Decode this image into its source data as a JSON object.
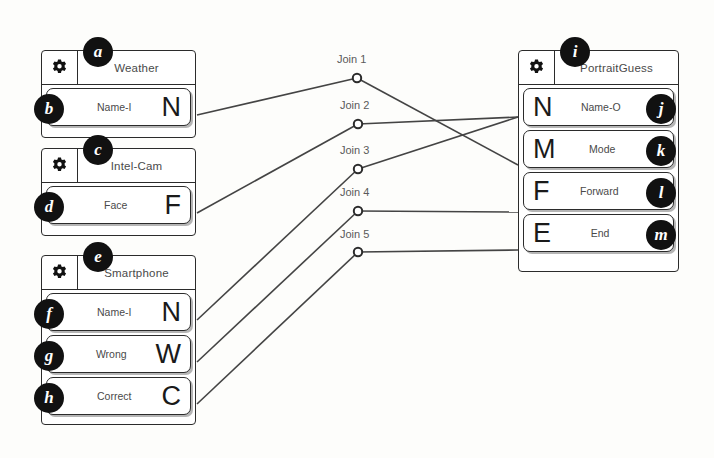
{
  "diagram": {
    "colors": {
      "line": "#444444",
      "box_border": "#2b2b2b",
      "badge_bg": "#111111",
      "text": "#4a4a4a",
      "background": "#fdfdfb"
    }
  },
  "nodes": [
    {
      "id": "weather",
      "title": "Weather",
      "icon": "gear-icon",
      "badge": "a",
      "x": 41,
      "y": 50,
      "w": 155,
      "h": 88,
      "ports": [
        {
          "name": "Name-I",
          "letter": "N",
          "badge": "b",
          "side": "right"
        }
      ]
    },
    {
      "id": "intel-cam",
      "title": "Intel-Cam",
      "icon": "gear-icon",
      "badge": "c",
      "x": 41,
      "y": 148,
      "w": 155,
      "h": 88,
      "ports": [
        {
          "name": "Face",
          "letter": "F",
          "badge": "d",
          "side": "right"
        }
      ]
    },
    {
      "id": "smartphone",
      "title": "Smartphone",
      "icon": "gear-icon",
      "badge": "e",
      "x": 41,
      "y": 255,
      "w": 155,
      "h": 170,
      "ports": [
        {
          "name": "Name-I",
          "letter": "N",
          "badge": "f",
          "side": "right"
        },
        {
          "name": "Wrong",
          "letter": "W",
          "badge": "g",
          "side": "right"
        },
        {
          "name": "Correct",
          "letter": "C",
          "badge": "h",
          "side": "right"
        }
      ]
    },
    {
      "id": "portraitguess",
      "title": "PortraitGuess",
      "icon": "gear-icon",
      "badge": "i",
      "x": 518,
      "y": 50,
      "w": 161,
      "h": 222,
      "ports": [
        {
          "name": "Name-O",
          "letter": "N",
          "badge": "j",
          "side": "left"
        },
        {
          "name": "Mode",
          "letter": "M",
          "badge": "k",
          "side": "left"
        },
        {
          "name": "Forward",
          "letter": "F",
          "badge": "l",
          "side": "left"
        },
        {
          "name": "End",
          "letter": "E",
          "badge": "m",
          "side": "left"
        }
      ]
    }
  ],
  "joins": [
    {
      "label": "Join 1",
      "x": 357,
      "y": 78,
      "label_x": 337,
      "label_y": 53,
      "from": {
        "x": 197,
        "y": 115
      },
      "to": {
        "x": 518,
        "y": 165
      }
    },
    {
      "label": "Join 2",
      "x": 358,
      "y": 124,
      "label_x": 340,
      "label_y": 99,
      "from": {
        "x": 197,
        "y": 213
      },
      "to": {
        "x": 518,
        "y": 117
      }
    },
    {
      "label": "Join 3",
      "x": 358,
      "y": 169,
      "label_x": 340,
      "label_y": 144,
      "from": {
        "x": 197,
        "y": 320
      },
      "to": {
        "x": 518,
        "y": 117
      }
    },
    {
      "label": "Join 4",
      "x": 358,
      "y": 211,
      "label_x": 340,
      "label_y": 186,
      "from": {
        "x": 197,
        "y": 362
      },
      "to": {
        "x": 518,
        "y": 212
      }
    },
    {
      "label": "Join 5",
      "x": 358,
      "y": 252,
      "label_x": 340,
      "label_y": 228,
      "from": {
        "x": 197,
        "y": 404
      },
      "to": {
        "x": 518,
        "y": 250
      }
    }
  ]
}
